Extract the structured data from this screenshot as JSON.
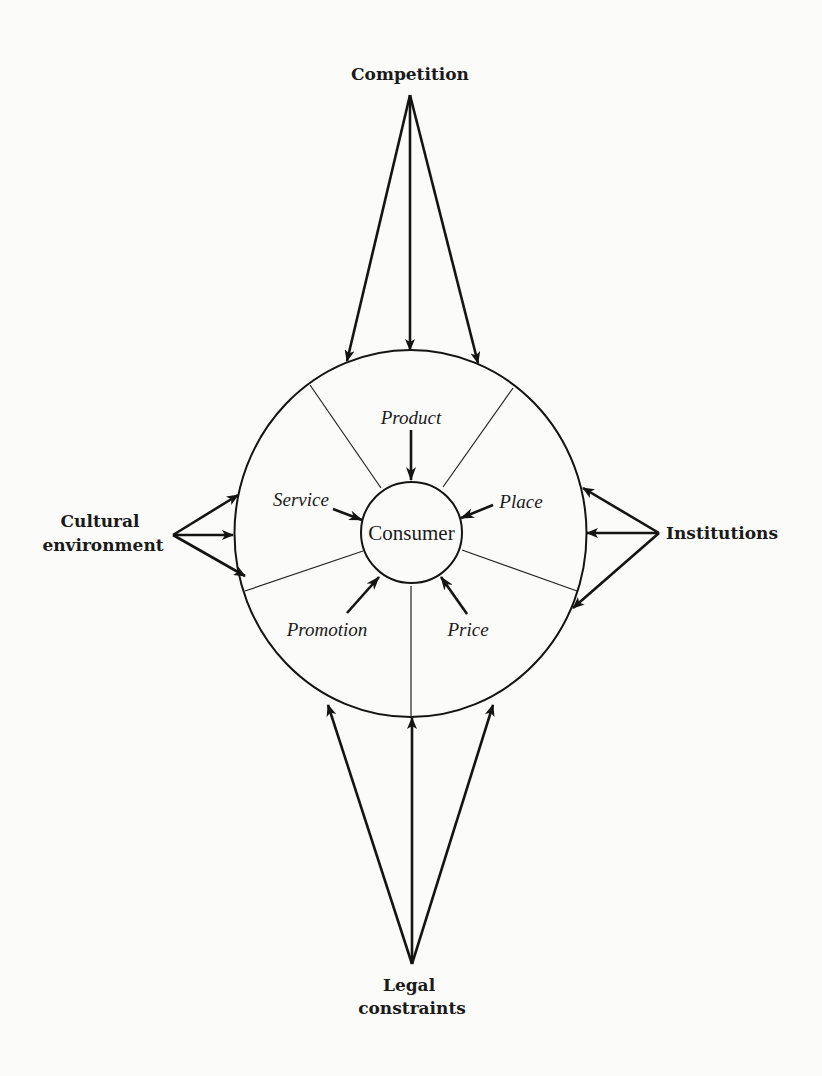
{
  "diagram": {
    "center": {
      "label": "Consumer"
    },
    "marketing_mix": [
      {
        "id": "product",
        "label": "Product"
      },
      {
        "id": "service",
        "label": "Service"
      },
      {
        "id": "place",
        "label": "Place"
      },
      {
        "id": "promotion",
        "label": "Promotion"
      },
      {
        "id": "price",
        "label": "Price"
      }
    ],
    "external_forces": {
      "top": {
        "id": "competition",
        "lines": [
          "Competition"
        ]
      },
      "left": {
        "id": "cultural-environment",
        "lines": [
          "Cultural",
          "environment"
        ]
      },
      "right": {
        "id": "institutions",
        "lines": [
          "Institutions"
        ]
      },
      "bottom": {
        "id": "legal-constraints",
        "lines": [
          "Legal",
          "constraints"
        ]
      }
    },
    "colors": {
      "ink": "#141414",
      "paper": "#fbfbf9"
    }
  }
}
